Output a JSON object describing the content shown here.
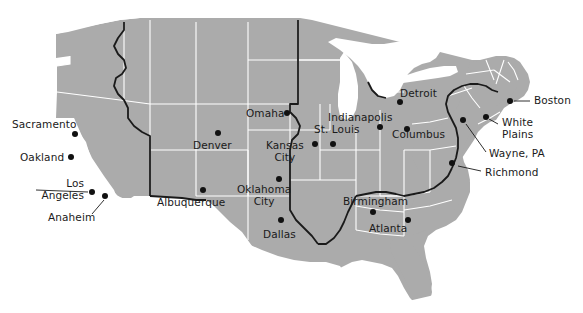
{
  "page": {
    "title_fragment": "mapping",
    "background_color": "#ffffff"
  },
  "map": {
    "name": "united-states-map",
    "land_color": "#ababab",
    "state_border_color": "#ffffff",
    "region_border_color": "#1a1a1a",
    "dot_color": "#111111",
    "label_color": "#1a1a1a",
    "ocean_color": "#ffffff"
  },
  "cities": [
    {
      "name": "Sacramento",
      "label": "Sacramento",
      "label_x": 12,
      "label_y": 119,
      "align": "left",
      "dot_x": 75,
      "dot_y": 134,
      "leader": false
    },
    {
      "name": "Oakland",
      "label": "Oakland",
      "label_x": 20,
      "label_y": 152,
      "align": "left",
      "dot_x": 71,
      "dot_y": 157,
      "leader": false
    },
    {
      "name": "Los Angeles",
      "label": "Los\nAngeles",
      "label_x": 28,
      "label_y": 178,
      "align": "right",
      "dot_x": 92,
      "dot_y": 192,
      "leader": true
    },
    {
      "name": "Anaheim",
      "label": "Anaheim",
      "label_x": 48,
      "label_y": 212,
      "align": "left",
      "dot_x": 105,
      "dot_y": 196,
      "leader": true
    },
    {
      "name": "Albuquerque",
      "label": "Albuquerque",
      "label_x": 157,
      "label_y": 197,
      "align": "left",
      "dot_x": 203,
      "dot_y": 190,
      "leader": false
    },
    {
      "name": "Denver",
      "label": "Denver",
      "label_x": 193,
      "label_y": 140,
      "align": "left",
      "dot_x": 218,
      "dot_y": 133,
      "leader": false
    },
    {
      "name": "Oklahoma City",
      "label": "Oklahoma\nCity",
      "label_x": 237,
      "label_y": 184,
      "align": "center",
      "dot_x": 279,
      "dot_y": 179,
      "leader": false
    },
    {
      "name": "Dallas",
      "label": "Dallas",
      "label_x": 263,
      "label_y": 229,
      "align": "left",
      "dot_x": 281,
      "dot_y": 220,
      "leader": false
    },
    {
      "name": "Omaha",
      "label": "Omaha",
      "label_x": 246,
      "label_y": 108,
      "align": "left",
      "dot_x": 287,
      "dot_y": 113,
      "leader": false
    },
    {
      "name": "Kansas City",
      "label": "Kansas\nCity",
      "label_x": 266,
      "label_y": 140,
      "align": "center",
      "dot_x": 315,
      "dot_y": 144,
      "leader": false
    },
    {
      "name": "St. Louis",
      "label": "St. Louis",
      "label_x": 314,
      "label_y": 124,
      "align": "left",
      "dot_x": 333,
      "dot_y": 144,
      "leader": false
    },
    {
      "name": "Indianapolis",
      "label": "Indianapolis",
      "label_x": 328,
      "label_y": 112,
      "align": "left",
      "dot_x": 380,
      "dot_y": 127,
      "leader": false
    },
    {
      "name": "Detroit",
      "label": "Detroit",
      "label_x": 400,
      "label_y": 88,
      "align": "left",
      "dot_x": 400,
      "dot_y": 102,
      "leader": false
    },
    {
      "name": "Columbus",
      "label": "Columbus",
      "label_x": 392,
      "label_y": 129,
      "align": "left",
      "dot_x": 407,
      "dot_y": 129,
      "leader": false
    },
    {
      "name": "Birmingham",
      "label": "Birmingham",
      "label_x": 343,
      "label_y": 196,
      "align": "left",
      "dot_x": 373,
      "dot_y": 212,
      "leader": false
    },
    {
      "name": "Atlanta",
      "label": "Atlanta",
      "label_x": 369,
      "label_y": 223,
      "align": "left",
      "dot_x": 408,
      "dot_y": 220,
      "leader": false
    },
    {
      "name": "Boston",
      "label": "Boston",
      "label_x": 534,
      "label_y": 95,
      "align": "left",
      "dot_x": 510,
      "dot_y": 101,
      "leader": true
    },
    {
      "name": "White Plains",
      "label": "White\nPlains",
      "label_x": 502,
      "label_y": 117,
      "align": "left",
      "dot_x": 486,
      "dot_y": 117,
      "leader": true
    },
    {
      "name": "Wayne, PA",
      "label": "Wayne, PA",
      "label_x": 489,
      "label_y": 148,
      "align": "left",
      "dot_x": 463,
      "dot_y": 120,
      "leader": true
    },
    {
      "name": "Richmond",
      "label": "Richmond",
      "label_x": 485,
      "label_y": 167,
      "align": "left",
      "dot_x": 452,
      "dot_y": 163,
      "leader": true
    }
  ]
}
